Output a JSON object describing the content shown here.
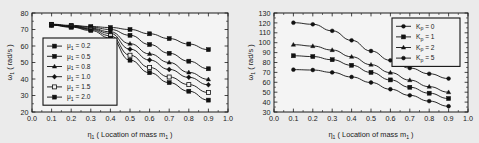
{
  "figure": {
    "background_color": "#ebebeb",
    "panel_count": 2
  },
  "chart_data": [
    {
      "id": "left",
      "type": "line",
      "title": "",
      "xlabel": "η₁ ( Location of mass  m₁ )",
      "xlabel_main": "η",
      "xlabel_sub": "1",
      "xlabel_rest": "( Location of mass  m",
      "xlabel_rest_sub": "1",
      "xlabel_tail": ")",
      "ylabel": "ω₁ ( rad/s )",
      "ylabel_main": "ω",
      "ylabel_sub": "1",
      "ylabel_rest": "( rad/s )",
      "xlim": [
        0.0,
        1.0
      ],
      "ylim": [
        20,
        80
      ],
      "xticks": [
        "0.0",
        "0.1",
        "0.2",
        "0.3",
        "0.4",
        "0.5",
        "0.6",
        "0.7",
        "0.8",
        "0.9",
        "1.0"
      ],
      "xtick_values": [
        0.0,
        0.1,
        0.2,
        0.3,
        0.4,
        0.5,
        0.6,
        0.7,
        0.8,
        0.9,
        1.0
      ],
      "yticks": [
        "20",
        "30",
        "40",
        "50",
        "60",
        "70",
        "80"
      ],
      "ytick_values": [
        20,
        30,
        40,
        50,
        60,
        70,
        80
      ],
      "grid": false,
      "legend_position": "lower-left",
      "legend_title": "",
      "x": [
        0.1,
        0.2,
        0.3,
        0.4,
        0.5,
        0.6,
        0.7,
        0.8,
        0.9
      ],
      "series": [
        {
          "name": "μ₁ = 0.2",
          "symbol_main": "μ",
          "symbol_sub": "1",
          "value_text": "= 0.2",
          "marker": "filled-square",
          "values": [
            73.2,
            72.5,
            71.8,
            71.2,
            70.0,
            67.4,
            64.5,
            61.2,
            57.8
          ]
        },
        {
          "name": "μ₁ = 0.5",
          "symbol_main": "μ",
          "symbol_sub": "1",
          "value_text": "= 0.5",
          "marker": "filled-square",
          "values": [
            73.0,
            72.2,
            71.4,
            70.0,
            66.5,
            60.9,
            55.6,
            50.8,
            46.2
          ]
        },
        {
          "name": "μ₁ = 0.8",
          "symbol_main": "μ",
          "symbol_sub": "1",
          "value_text": "= 0.8",
          "marker": "filled-triangle",
          "values": [
            72.9,
            72.0,
            70.8,
            68.6,
            61.4,
            55.2,
            50.0,
            44.0,
            39.8
          ]
        },
        {
          "name": "μ₁ = 1.0",
          "symbol_main": "μ",
          "symbol_sub": "1",
          "value_text": "= 1.0",
          "marker": "filled-diamond",
          "values": [
            72.8,
            71.8,
            70.4,
            67.6,
            58.1,
            51.5,
            45.8,
            41.0,
            36.5
          ]
        },
        {
          "name": "μ₁ = 1.5",
          "symbol_main": "μ",
          "symbol_sub": "1",
          "value_text": "= 1.5",
          "marker": "open-square",
          "values": [
            72.7,
            71.6,
            70.0,
            66.2,
            54.4,
            47.0,
            41.2,
            36.6,
            31.8
          ]
        },
        {
          "name": "μ₁ = 2.0",
          "symbol_main": "μ",
          "symbol_sub": "1",
          "value_text": "= 2.0",
          "marker": "filled-square",
          "values": [
            72.6,
            71.4,
            69.4,
            64.8,
            51.4,
            43.8,
            37.8,
            32.6,
            27.2
          ]
        }
      ]
    },
    {
      "id": "right",
      "type": "line",
      "title": "",
      "xlabel": "η₁ ( Location of mass  m₁ )",
      "xlabel_main": "η",
      "xlabel_sub": "1",
      "xlabel_rest": "( Location of mass  m",
      "xlabel_rest_sub": "1",
      "xlabel_tail": ")",
      "ylabel": "ω₁ ( rad/s )",
      "ylabel_main": "ω",
      "ylabel_sub": "1",
      "ylabel_rest": "( rad/s )",
      "xlim": [
        0.0,
        1.0
      ],
      "ylim": [
        30,
        130
      ],
      "xticks": [
        "0.0",
        "0.1",
        "0.2",
        "0.3",
        "0.4",
        "0.5",
        "0.6",
        "0.7",
        "0.8",
        "0.9",
        "1.0"
      ],
      "xtick_values": [
        0.0,
        0.1,
        0.2,
        0.3,
        0.4,
        0.5,
        0.6,
        0.7,
        0.8,
        0.9,
        1.0
      ],
      "yticks": [
        "30",
        "40",
        "50",
        "60",
        "70",
        "80",
        "90",
        "100",
        "110",
        "120",
        "130"
      ],
      "ytick_values": [
        30,
        40,
        50,
        60,
        70,
        80,
        90,
        100,
        110,
        120,
        130
      ],
      "grid": false,
      "legend_position": "upper-right",
      "legend_title": "",
      "x": [
        0.1,
        0.2,
        0.3,
        0.4,
        0.5,
        0.6,
        0.7,
        0.8,
        0.9
      ],
      "series": [
        {
          "name": "Kₚ = 5",
          "symbol_main": "K",
          "symbol_sub": "p",
          "value_text": "= 5",
          "marker": "filled-circle",
          "values": [
            120.2,
            118.6,
            112.0,
            102.4,
            91.6,
            82.2,
            74.4,
            68.6,
            63.8
          ]
        },
        {
          "name": "Kₚ = 2",
          "symbol_main": "K",
          "symbol_sub": "p",
          "value_text": "= 2",
          "marker": "filled-triangle",
          "values": [
            98.0,
            96.6,
            92.6,
            85.8,
            77.8,
            69.8,
            62.2,
            55.6,
            50.0
          ]
        },
        {
          "name": "Kₚ = 1",
          "symbol_main": "K",
          "symbol_sub": "p",
          "value_text": "= 1",
          "marker": "filled-square",
          "values": [
            86.8,
            86.0,
            82.8,
            77.2,
            70.0,
            62.4,
            55.0,
            49.0,
            43.6
          ]
        },
        {
          "name": "Kₚ = 0",
          "symbol_main": "K",
          "symbol_sub": "p",
          "value_text": "= 0",
          "marker": "filled-circle",
          "values": [
            72.8,
            72.4,
            70.0,
            65.4,
            59.8,
            53.0,
            46.8,
            41.0,
            35.8
          ]
        }
      ],
      "legend_order": [
        {
          "symbol_main": "K",
          "symbol_sub": "p",
          "value_text": "= 0",
          "marker": "filled-circle"
        },
        {
          "symbol_main": "K",
          "symbol_sub": "p",
          "value_text": "= 1",
          "marker": "filled-square"
        },
        {
          "symbol_main": "K",
          "symbol_sub": "p",
          "value_text": "= 2",
          "marker": "filled-triangle"
        },
        {
          "symbol_main": "K",
          "symbol_sub": "p",
          "value_text": "= 5",
          "marker": "filled-circle"
        }
      ]
    }
  ]
}
